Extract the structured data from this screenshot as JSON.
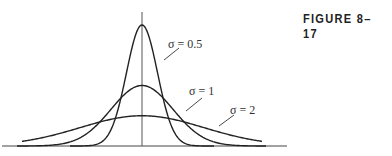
{
  "figure": {
    "label": "FIGURE 8–17"
  },
  "chart_data": {
    "type": "line",
    "title": "",
    "xlabel": "",
    "ylabel": "",
    "grid": false,
    "legend": "inline labels with leader lines",
    "series": [
      {
        "name": "σ = 0.5",
        "sigma": 0.5,
        "mean": 0,
        "peak_relative": 1.0
      },
      {
        "name": "σ = 1",
        "sigma": 1,
        "mean": 0,
        "peak_relative": 0.5
      },
      {
        "name": "σ = 2",
        "sigma": 2,
        "mean": 0,
        "peak_relative": 0.25
      }
    ],
    "annotations": [
      "σ = 0.5",
      "σ = 1",
      "σ = 2"
    ]
  },
  "labels": {
    "s05": "σ = 0.5",
    "s1": "σ = 1",
    "s2": "σ = 2"
  }
}
